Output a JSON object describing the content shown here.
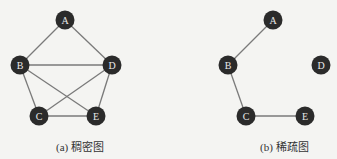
{
  "graphs": [
    {
      "id": "dense",
      "caption": "(a) 稠密图",
      "nodes": [
        {
          "id": "A",
          "x": 65,
          "y": 20
        },
        {
          "id": "B",
          "x": 20,
          "y": 65
        },
        {
          "id": "D",
          "x": 112,
          "y": 65
        },
        {
          "id": "C",
          "x": 39,
          "y": 116
        },
        {
          "id": "E",
          "x": 96,
          "y": 116
        }
      ],
      "edges": [
        [
          "A",
          "B"
        ],
        [
          "A",
          "D"
        ],
        [
          "B",
          "D"
        ],
        [
          "B",
          "C"
        ],
        [
          "B",
          "E"
        ],
        [
          "D",
          "C"
        ],
        [
          "D",
          "E"
        ],
        [
          "C",
          "E"
        ]
      ]
    },
    {
      "id": "sparse",
      "caption": "(b) 稀疏图",
      "nodes": [
        {
          "id": "A",
          "x": 273,
          "y": 20
        },
        {
          "id": "B",
          "x": 228,
          "y": 65
        },
        {
          "id": "D",
          "x": 321,
          "y": 65
        },
        {
          "id": "C",
          "x": 246,
          "y": 116
        },
        {
          "id": "E",
          "x": 305,
          "y": 116
        }
      ],
      "edges": [
        [
          "A",
          "B"
        ],
        [
          "B",
          "C"
        ],
        [
          "C",
          "E"
        ]
      ]
    }
  ],
  "colors": {
    "node_fill": "#2b2b2b",
    "node_label": "#e8e8e8",
    "edge": "#7a7a7a",
    "background": "#f4f4f2"
  }
}
